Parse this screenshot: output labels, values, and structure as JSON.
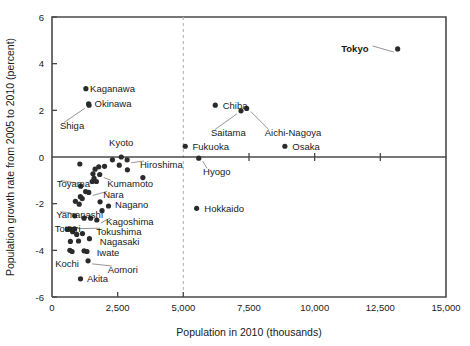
{
  "chart_data": {
    "type": "scatter",
    "title": "",
    "xlabel": "Population in 2010 (thousands)",
    "ylabel": "Population growth rate from 2005 to 2010 (percent)",
    "xlim": [
      0,
      15000
    ],
    "ylim": [
      -6,
      6
    ],
    "xticks": [
      0,
      2500,
      5000,
      7500,
      10000,
      12500,
      15000
    ],
    "xtick_labels": [
      "0",
      "2,500",
      "5,000",
      "7,500",
      "10,000",
      "12,500",
      "15,000"
    ],
    "yticks": [
      -6,
      -4,
      -2,
      0,
      2,
      4,
      6
    ],
    "ytick_labels": [
      "-6",
      "-4",
      "-2",
      "0",
      "2",
      "4",
      "6"
    ],
    "grid": false,
    "legend": "none",
    "zero_line_y": 0,
    "reference_line_x": 5000,
    "reference_line_style": "dashed",
    "points": [
      {
        "name": "Tokyo",
        "x": 13160,
        "y": 4.63,
        "labeled": true,
        "bold": true,
        "label_x": 12050,
        "label_y": 4.63,
        "anchor": "end",
        "leader": true
      },
      {
        "name": "Kaganawa",
        "x": 9048,
        "y": 2.93,
        "labeled": true,
        "bold": false,
        "label_x": 1450,
        "label_y": 2.93,
        "anchor": "start",
        "leader": false,
        "marker_x": 1290,
        "marker_y": 2.93
      },
      {
        "name": "Okinawa",
        "x": 1393,
        "y": 2.28,
        "labeled": true,
        "bold": false,
        "label_x": 1620,
        "label_y": 2.28,
        "anchor": "start",
        "leader": false
      },
      {
        "name": "Shiga",
        "x": 1411,
        "y": 2.22,
        "labeled": true,
        "bold": false,
        "label_x": 300,
        "label_y": 1.35,
        "anchor": "start",
        "leader": true
      },
      {
        "name": "Chiba",
        "x": 6216,
        "y": 2.22,
        "labeled": true,
        "bold": false,
        "label_x": 6500,
        "label_y": 2.22,
        "anchor": "start",
        "leader": false
      },
      {
        "name": "Saitama",
        "x": 7195,
        "y": 1.98,
        "labeled": true,
        "bold": false,
        "label_x": 6050,
        "label_y": 1.05,
        "anchor": "start",
        "leader": true
      },
      {
        "name": "Aichi-Nagoya",
        "x": 7411,
        "y": 2.08,
        "labeled": true,
        "bold": false,
        "label_x": 8100,
        "label_y": 1.05,
        "anchor": "start",
        "leader": true
      },
      {
        "name": "Fukuoka",
        "x": 5072,
        "y": 0.46,
        "labeled": true,
        "bold": false,
        "label_x": 5350,
        "label_y": 0.46,
        "anchor": "start",
        "leader": false
      },
      {
        "name": "Osaka",
        "x": 8865,
        "y": 0.46,
        "labeled": true,
        "bold": false,
        "label_x": 9150,
        "label_y": 0.46,
        "anchor": "start",
        "leader": false
      },
      {
        "name": "Kyoto",
        "x": 2636,
        "y": 0.0,
        "labeled": true,
        "bold": false,
        "label_x": 2636,
        "label_y": 0.62,
        "anchor": "middle",
        "leader": false
      },
      {
        "name": "Hiroshima",
        "x": 2861,
        "y": -0.12,
        "labeled": true,
        "bold": false,
        "label_x": 3350,
        "label_y": -0.3,
        "anchor": "start",
        "leader": true
      },
      {
        "name": "Hyogo",
        "x": 5588,
        "y": -0.05,
        "labeled": true,
        "bold": false,
        "label_x": 5750,
        "label_y": -0.62,
        "anchor": "start",
        "leader": true
      },
      {
        "name": "Hokkaido",
        "x": 5506,
        "y": -2.2,
        "labeled": true,
        "bold": false,
        "label_x": 5800,
        "label_y": -2.2,
        "anchor": "start",
        "leader": false
      },
      {
        "name": "Toyama",
        "x": 1093,
        "y": -1.25,
        "labeled": true,
        "bold": false,
        "label_x": 180,
        "label_y": -1.13,
        "anchor": "start",
        "leader": true
      },
      {
        "name": "Kumamoto",
        "x": 1817,
        "y": -0.75,
        "labeled": true,
        "bold": false,
        "label_x": 2100,
        "label_y": -1.13,
        "anchor": "start",
        "leader": true
      },
      {
        "name": "Nara",
        "x": 1400,
        "y": -1.52,
        "labeled": true,
        "bold": false,
        "label_x": 1950,
        "label_y": -1.6,
        "anchor": "start",
        "leader": true
      },
      {
        "name": "Nagano",
        "x": 2152,
        "y": -2.1,
        "labeled": true,
        "bold": false,
        "label_x": 2400,
        "label_y": -2.05,
        "anchor": "start",
        "leader": false
      },
      {
        "name": "Yamanashi",
        "x": 863,
        "y": -2.52,
        "labeled": true,
        "bold": false,
        "label_x": 160,
        "label_y": -2.48,
        "anchor": "start",
        "leader": true
      },
      {
        "name": "Kagoshima",
        "x": 1706,
        "y": -2.7,
        "labeled": true,
        "bold": false,
        "label_x": 2060,
        "label_y": -2.75,
        "anchor": "start",
        "leader": true
      },
      {
        "name": "Tottori",
        "x": 588,
        "y": -3.1,
        "labeled": true,
        "bold": false,
        "label_x": 100,
        "label_y": -3.05,
        "anchor": "start",
        "leader": false
      },
      {
        "name": "Tokushima",
        "x": 785,
        "y": -3.2,
        "labeled": true,
        "bold": false,
        "label_x": 1680,
        "label_y": -3.18,
        "anchor": "start",
        "leader": true
      },
      {
        "name": "Nagasaki",
        "x": 1426,
        "y": -3.5,
        "labeled": true,
        "bold": false,
        "label_x": 1820,
        "label_y": -3.62,
        "anchor": "start",
        "leader": false
      },
      {
        "name": "Iwate",
        "x": 1330,
        "y": -4.05,
        "labeled": true,
        "bold": false,
        "label_x": 1700,
        "label_y": -4.1,
        "anchor": "start",
        "leader": false
      },
      {
        "name": "Kochi",
        "x": 764,
        "y": -4.05,
        "labeled": true,
        "bold": false,
        "label_x": 120,
        "label_y": -4.55,
        "anchor": "start",
        "leader": false
      },
      {
        "name": "Aomori",
        "x": 1373,
        "y": -4.45,
        "labeled": true,
        "bold": false,
        "label_x": 2120,
        "label_y": -4.8,
        "anchor": "start",
        "leader": true
      },
      {
        "name": "Akita",
        "x": 1086,
        "y": -5.22,
        "labeled": true,
        "bold": false,
        "label_x": 1330,
        "label_y": -5.22,
        "anchor": "start",
        "leader": false
      },
      {
        "name": "p1",
        "x": 1060,
        "y": -0.3,
        "labeled": false
      },
      {
        "name": "p2",
        "x": 1640,
        "y": -0.52,
        "labeled": false
      },
      {
        "name": "p3",
        "x": 1780,
        "y": -0.42,
        "labeled": false
      },
      {
        "name": "p4",
        "x": 2000,
        "y": -0.4,
        "labeled": false
      },
      {
        "name": "p5",
        "x": 2300,
        "y": -0.12,
        "labeled": false
      },
      {
        "name": "p6",
        "x": 2560,
        "y": -0.35,
        "labeled": false
      },
      {
        "name": "p7",
        "x": 2870,
        "y": -0.55,
        "labeled": false
      },
      {
        "name": "p8",
        "x": 3460,
        "y": -0.88,
        "labeled": false
      },
      {
        "name": "p9",
        "x": 1560,
        "y": -0.72,
        "labeled": false
      },
      {
        "name": "p10",
        "x": 1600,
        "y": -0.92,
        "labeled": false
      },
      {
        "name": "p11",
        "x": 1530,
        "y": -1.05,
        "labeled": false
      },
      {
        "name": "p12",
        "x": 1690,
        "y": -1.05,
        "labeled": false
      },
      {
        "name": "p13",
        "x": 1280,
        "y": -1.48,
        "labeled": false
      },
      {
        "name": "p14",
        "x": 1080,
        "y": -1.7,
        "labeled": false
      },
      {
        "name": "p15",
        "x": 1150,
        "y": -1.78,
        "labeled": false
      },
      {
        "name": "p16",
        "x": 890,
        "y": -1.9,
        "labeled": false
      },
      {
        "name": "p17",
        "x": 1035,
        "y": -2.02,
        "labeled": false
      },
      {
        "name": "p18",
        "x": 1830,
        "y": -1.92,
        "labeled": false
      },
      {
        "name": "p19",
        "x": 1905,
        "y": -2.3,
        "labeled": false
      },
      {
        "name": "p20",
        "x": 1220,
        "y": -2.62,
        "labeled": false
      },
      {
        "name": "p21",
        "x": 1470,
        "y": -2.62,
        "labeled": false
      },
      {
        "name": "p22",
        "x": 680,
        "y": -3.08,
        "labeled": false
      },
      {
        "name": "p23",
        "x": 855,
        "y": -3.08,
        "labeled": false
      },
      {
        "name": "p24",
        "x": 940,
        "y": -3.32,
        "labeled": false
      },
      {
        "name": "p25",
        "x": 1160,
        "y": -3.28,
        "labeled": false
      },
      {
        "name": "p26",
        "x": 700,
        "y": -3.62,
        "labeled": false
      },
      {
        "name": "p27",
        "x": 1010,
        "y": -3.6,
        "labeled": false
      },
      {
        "name": "p28",
        "x": 680,
        "y": -4.0,
        "labeled": false
      },
      {
        "name": "p29",
        "x": 1220,
        "y": -4.02,
        "labeled": false
      }
    ]
  }
}
